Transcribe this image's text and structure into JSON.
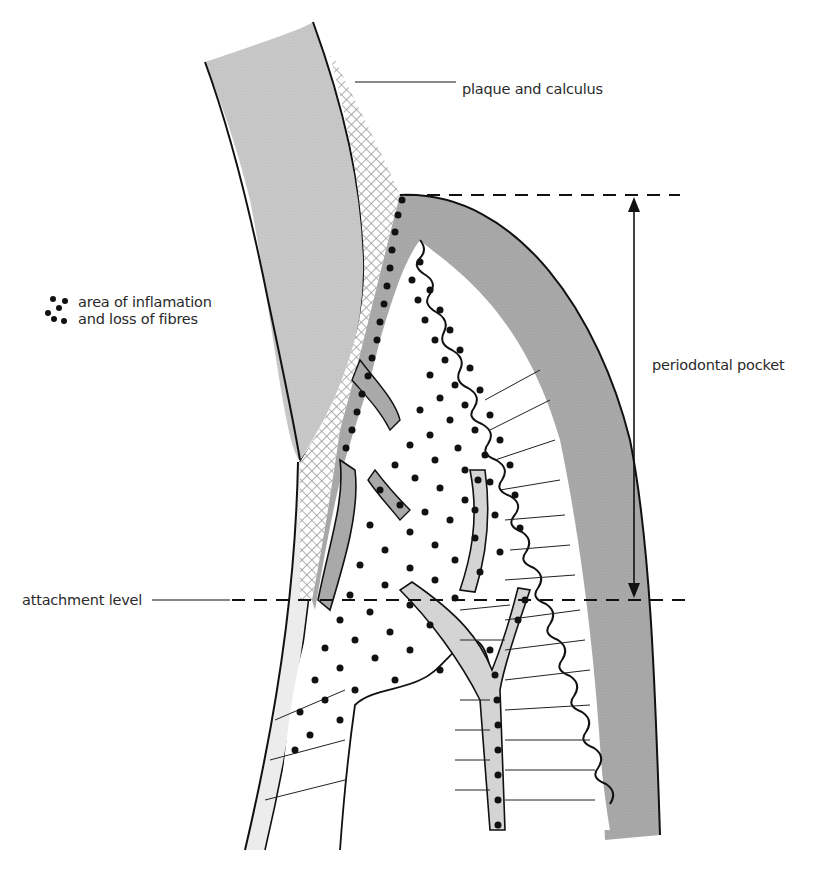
{
  "figure": {
    "type": "anatomical diagram",
    "labels": {
      "plaque": "plaque and calculus",
      "inflammation_line1": "area of inflamation",
      "inflammation_line2": "and loss of fibres",
      "pocket": "periodontal pocket",
      "attachment": "attachment level"
    },
    "legend": {
      "icon": "dot-cluster-icon",
      "meaning": "area of inflamation and loss of fibres"
    },
    "colors": {
      "tooth": "#c8c8c8",
      "gingiva": "#a9a9a9",
      "vessel": "#d4d4d4",
      "calculus_hatch": "#9a9a9a",
      "outline": "#111111",
      "background": "#ffffff"
    },
    "markers": {
      "pocket_top_y": 195,
      "attachment_level_y": 600,
      "arrow_x": 634
    }
  }
}
